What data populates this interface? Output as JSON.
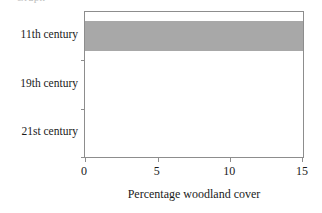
{
  "caption_remnant": "Graph",
  "chart_data": {
    "type": "bar",
    "orientation": "horizontal",
    "title": "",
    "subtitle": "",
    "xlabel": "Percentage woodland cover",
    "ylabel": "",
    "categories": [
      "11th century",
      "19th century",
      "21st century"
    ],
    "values": [
      15,
      0,
      0
    ],
    "series": [
      {
        "name": "Percentage woodland cover",
        "values": [
          15,
          0,
          0
        ]
      }
    ],
    "xlim": [
      0,
      15
    ],
    "xticks": [
      0,
      5,
      10,
      15
    ],
    "xtick_labels": [
      "0",
      "5",
      "10",
      "15"
    ],
    "grid": false,
    "legend": false,
    "legend_position": "none",
    "bar_color": "#a8a8a8",
    "frame_color": "#8d8d8d",
    "background_color": "#ffffff"
  }
}
